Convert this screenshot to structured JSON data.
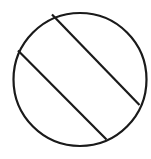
{
  "diagram": {
    "stroke_color": "#1a1a1a",
    "background": "#ffffff",
    "circle": {
      "cx": 80,
      "cy": 79.5,
      "r": 66.5
    },
    "chords": [
      {
        "x1": 52,
        "y1": 14.5,
        "x2": 139.5,
        "y2": 105
      },
      {
        "x1": 18,
        "y1": 50.5,
        "x2": 106.5,
        "y2": 139.5
      }
    ]
  }
}
